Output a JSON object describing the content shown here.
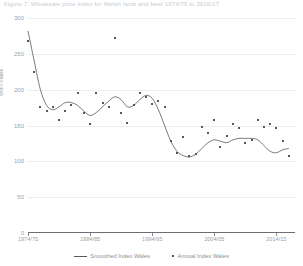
{
  "title": "Figure 7: Wholesale price index for Welsh lamb and beef 1974/75 to 2016/17",
  "axes": {
    "ylabel": "WIFI Index",
    "yticks": [
      "0",
      "50",
      "100",
      "150",
      "200",
      "250",
      "300"
    ],
    "xticks": [
      "1974/75",
      "1984/85",
      "1994/95",
      "2004/05",
      "2014/15"
    ]
  },
  "legend": {
    "items": [
      {
        "label": "Smoothed Index Wales",
        "marker": "line",
        "color": "#57575c"
      },
      {
        "label": "Annual Index Wales",
        "marker": "dot",
        "color": "#57575c"
      }
    ]
  },
  "chart_data": {
    "type": "line",
    "title": "Figure 7: Wholesale price index for Welsh lamb and beef 1974/75 to 2016/17",
    "xlabel": "",
    "ylabel": "WIFI Index",
    "ylim": [
      0,
      300
    ],
    "xlim": [
      1974,
      2017
    ],
    "grid": true,
    "legend_position": "bottom",
    "x": [
      1974,
      1975,
      1976,
      1977,
      1978,
      1979,
      1980,
      1981,
      1982,
      1983,
      1984,
      1985,
      1986,
      1987,
      1988,
      1989,
      1990,
      1991,
      1992,
      1993,
      1994,
      1995,
      1996,
      1997,
      1998,
      1999,
      2000,
      2001,
      2002,
      2003,
      2004,
      2005,
      2006,
      2007,
      2008,
      2009,
      2010,
      2011,
      2012,
      2013,
      2014,
      2015,
      2016
    ],
    "xtick_labels": [
      "1974/75",
      "1984/85",
      "1994/95",
      "2004/05",
      "2014/15"
    ],
    "xtick_values": [
      1974,
      1984,
      1994,
      2004,
      2014
    ],
    "series": [
      {
        "name": "Annual Index Wales",
        "type": "scatter",
        "color": "#57575c",
        "values": [
          268,
          225,
          176,
          170,
          176,
          158,
          170,
          178,
          196,
          168,
          152,
          196,
          182,
          176,
          272,
          168,
          154,
          178,
          196,
          190,
          180,
          184,
          176,
          128,
          112,
          134,
          108,
          110,
          148,
          140,
          158,
          120,
          136,
          152,
          146,
          126,
          130,
          158,
          148,
          152,
          146,
          128,
          108
        ]
      },
      {
        "name": "Smoothed Index Wales",
        "type": "line",
        "color": "#57575c",
        "values": [
          282,
          240,
          200,
          178,
          172,
          176,
          182,
          182,
          178,
          170,
          164,
          168,
          176,
          184,
          190,
          186,
          176,
          178,
          186,
          192,
          188,
          172,
          150,
          128,
          114,
          108,
          106,
          110,
          118,
          126,
          130,
          128,
          126,
          130,
          132,
          132,
          132,
          130,
          122,
          114,
          112,
          116,
          118
        ]
      }
    ]
  }
}
